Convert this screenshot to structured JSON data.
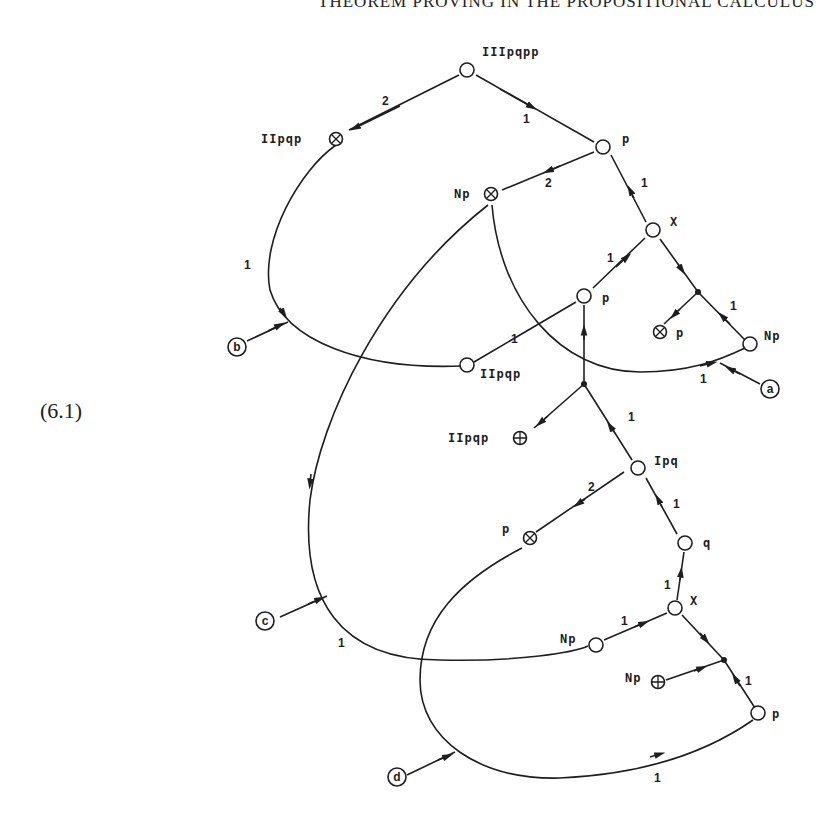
{
  "header": {
    "running_title": "THEOREM PROVING IN THE PROPOSITIONAL CALCULUS"
  },
  "equation_label": "(6.1)",
  "diagram": {
    "nodes": [
      {
        "id": "n1",
        "label": "IIIpqpp",
        "type": "open"
      },
      {
        "id": "n2",
        "label": "IIpqp",
        "type": "crossed"
      },
      {
        "id": "n3",
        "label": "p",
        "type": "open"
      },
      {
        "id": "n4",
        "label": "Np",
        "type": "crossed"
      },
      {
        "id": "n5",
        "label": "X",
        "type": "open"
      },
      {
        "id": "n6",
        "label": "p",
        "type": "open"
      },
      {
        "id": "n7",
        "label": "p",
        "type": "crossed"
      },
      {
        "id": "n8",
        "label": "Np",
        "type": "open"
      },
      {
        "id": "n9",
        "label": "IIpqp",
        "type": "open"
      },
      {
        "id": "n10",
        "label": "IIpqp",
        "type": "plus"
      },
      {
        "id": "n11",
        "label": "Ipq",
        "type": "open"
      },
      {
        "id": "n12",
        "label": "p",
        "type": "crossed"
      },
      {
        "id": "n13",
        "label": "q",
        "type": "open"
      },
      {
        "id": "n14",
        "label": "X",
        "type": "open"
      },
      {
        "id": "n15",
        "label": "Np",
        "type": "open"
      },
      {
        "id": "n16",
        "label": "Np",
        "type": "plus"
      },
      {
        "id": "n17",
        "label": "p",
        "type": "open"
      }
    ],
    "entry_points": [
      "a",
      "b",
      "c",
      "d"
    ],
    "edge_weights": {
      "w_n1_n2": "2",
      "w_n3_n1": "1",
      "w_n3_n4": "2",
      "w_n5_n3": "1",
      "w_n6_n5": "1",
      "w_n8_j1": "1",
      "w_b_arc": "1",
      "w_n9_n6": "1",
      "w_a_arc": "1",
      "w_n11_j2": "1",
      "w_n11_n12": "2",
      "w_n13_n11": "1",
      "w_n14_n13": "1",
      "w_n15_n14": "1",
      "w_n17_j3": "1",
      "w_c_arc": "1",
      "w_d_arc": "1"
    }
  }
}
